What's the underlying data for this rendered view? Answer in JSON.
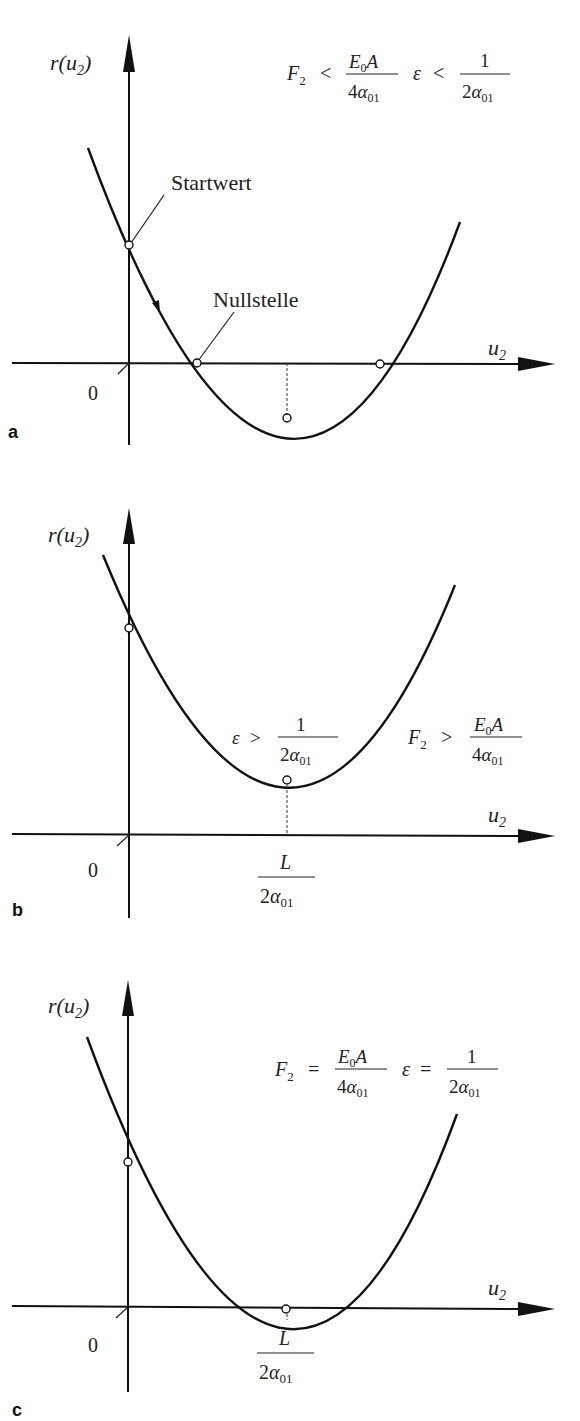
{
  "figure": {
    "panels": [
      {
        "id": "a",
        "panel_label": "a",
        "y_axis_label": "r(u",
        "y_axis_sub": "2",
        "y_axis_close": ")",
        "x_axis_label": "u",
        "x_axis_sub": "2",
        "origin_label": "0",
        "condition_F": {
          "lhs": "F",
          "lhs_sub": "2",
          "op": "<",
          "num": "E",
          "num_sub": "0",
          "num_tail": "A",
          "den": "4α",
          "den_sub": "01"
        },
        "condition_eps": {
          "lhs": "ε",
          "op": "<",
          "num": "1",
          "den": "2α",
          "den_sub": "01"
        },
        "annotation_start": "Startwert",
        "annotation_root": "Nullstelle"
      },
      {
        "id": "b",
        "panel_label": "b",
        "y_axis_label": "r(u",
        "y_axis_sub": "2",
        "y_axis_close": ")",
        "x_axis_label": "u",
        "x_axis_sub": "2",
        "origin_label": "0",
        "condition_eps": {
          "lhs": "ε",
          "op": ">",
          "num": "1",
          "den": "2α",
          "den_sub": "01"
        },
        "condition_F": {
          "lhs": "F",
          "lhs_sub": "2",
          "op": ">",
          "num": "E",
          "num_sub": "0",
          "num_tail": "A",
          "den": "4α",
          "den_sub": "01"
        },
        "x_tick": {
          "num": "L",
          "den": "2α",
          "den_sub": "01"
        }
      },
      {
        "id": "c",
        "panel_label": "c",
        "y_axis_label": "r(u",
        "y_axis_sub": "2",
        "y_axis_close": ")",
        "x_axis_label": "u",
        "x_axis_sub": "2",
        "origin_label": "0",
        "condition_F": {
          "lhs": "F",
          "lhs_sub": "2",
          "op": "=",
          "num": "E",
          "num_sub": "0",
          "num_tail": "A",
          "den": "4α",
          "den_sub": "01"
        },
        "condition_eps": {
          "lhs": "ε",
          "op": "=",
          "num": "1",
          "den": "2α",
          "den_sub": "01"
        },
        "x_tick": {
          "num": "L",
          "den": "2α",
          "den_sub": "01"
        }
      }
    ]
  }
}
